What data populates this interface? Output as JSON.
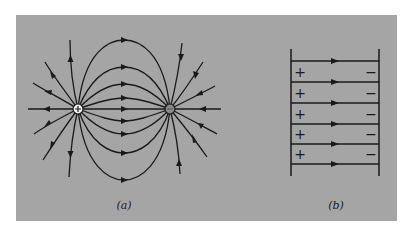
{
  "figure": {
    "panel_color": "#a5a5a5",
    "line_color": "#1a1a1a",
    "panel_a": {
      "caption": "(a)",
      "description": "Electric field lines of a dipole: positive charge (left) and negative charge (right)",
      "positive_charge": {
        "label": "+",
        "x": 78,
        "y": 109
      },
      "negative_charge": {
        "label": "−",
        "x": 170,
        "y": 109
      }
    },
    "panel_b": {
      "caption": "(b)",
      "description": "Uniform electric field between parallel plates",
      "left_plate_signs": [
        "+",
        "+",
        "+",
        "+",
        "+"
      ],
      "right_plate_signs": [
        "−",
        "−",
        "−",
        "−",
        "−"
      ],
      "field_line_count": 6
    }
  }
}
